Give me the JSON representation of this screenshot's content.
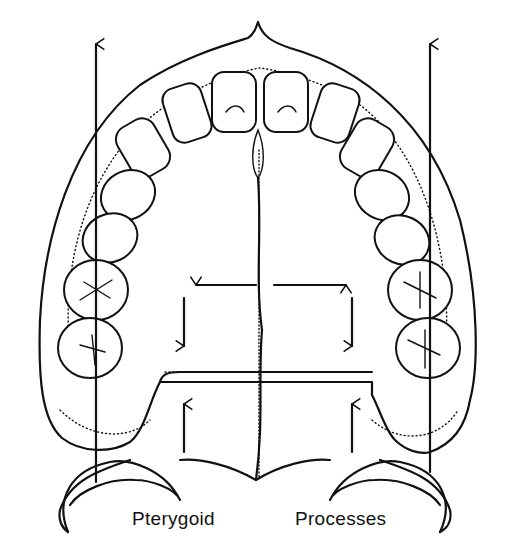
{
  "figure": {
    "labels": {
      "left": "Pterygoid",
      "right": "Processes"
    },
    "arrows": [
      {
        "name": "left-vertical-arrow",
        "direction": "up"
      },
      {
        "name": "right-vertical-arrow",
        "direction": "up"
      },
      {
        "name": "horizontal-arrow-left",
        "direction": "left"
      },
      {
        "name": "horizontal-arrow-right",
        "direction": "right"
      },
      {
        "name": "left-down-arrow",
        "direction": "down"
      },
      {
        "name": "right-down-arrow",
        "direction": "down"
      },
      {
        "name": "left-up-arrow",
        "direction": "up"
      },
      {
        "name": "right-up-arrow",
        "direction": "up"
      }
    ],
    "colors": {
      "line": "#111111",
      "background": "#ffffff"
    }
  }
}
